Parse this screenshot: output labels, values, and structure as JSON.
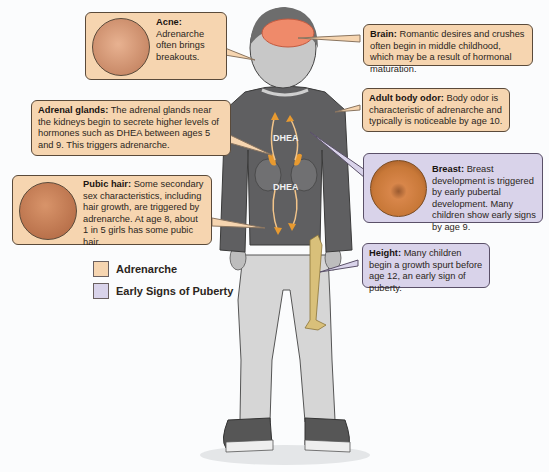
{
  "colors": {
    "adrenarche": "#f6d5b0",
    "early_puberty": "#d9d3ea",
    "sweater": "#5d5d5f",
    "pants": "#d4d4d4",
    "bone": "#d9c07a",
    "brain": "#ef8a6a"
  },
  "callouts": {
    "acne": {
      "title": "Acne:",
      "body": "Adrenarche often brings breakouts.",
      "category": "Adrenarche"
    },
    "brain": {
      "title": "Brain:",
      "body": "Romantic desires and crushes often begin in middle childhood, which may be a result of hormonal maturation.",
      "category": "Adrenarche"
    },
    "adrenal": {
      "title": "Adrenal glands:",
      "body": "The adrenal glands near the kidneys begin to secrete higher levels of hormones such as DHEA between ages 5 and 9. This triggers adrenarche.",
      "category": "Adrenarche"
    },
    "odor": {
      "title": "Adult body odor:",
      "body": "Body odor is characteristic of adrenarche and typically is noticeable by age 10.",
      "category": "Adrenarche"
    },
    "breast": {
      "title": "Breast:",
      "body": "Breast development is triggered by early pubertal development. Many children show early signs by age 9.",
      "category": "Early Signs of Puberty"
    },
    "pubic": {
      "title": "Pubic hair:",
      "body": "Some secondary sex characteristics, including hair growth, are triggered by adrenarche. At age 8, about 1 in 5 girls has some pubic hair.",
      "category": "Adrenarche"
    },
    "height": {
      "title": "Height:",
      "body": "Many children begin a growth spurt before age 12, an early sign of puberty.",
      "category": "Early Signs of Puberty"
    }
  },
  "figure_labels": {
    "dhea_top": "DHEA",
    "dhea_bottom": "DHEA"
  },
  "legend": [
    {
      "label": "Adrenarche",
      "color": "#f6d5b0"
    },
    {
      "label": "Early Signs of Puberty",
      "color": "#d9d3ea"
    }
  ]
}
